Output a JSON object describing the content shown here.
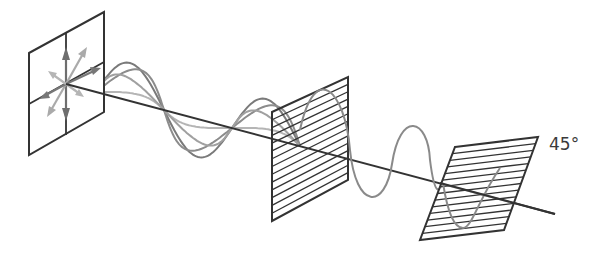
{
  "diagram": {
    "colors": {
      "frame": "#333333",
      "wave_dark": "#7a7a7a",
      "wave_mid": "#8f8f8f",
      "wave_light": "#b5b5b5",
      "axis": "#333333"
    },
    "elements": {
      "source_panel": "Unpolarized light source (arrows in all directions)",
      "first_polarizer": "Vertical polarizer (horizontal lines)",
      "second_polarizer": "Polarizer rotated 45°"
    },
    "labels": {
      "angle": "45°"
    }
  }
}
